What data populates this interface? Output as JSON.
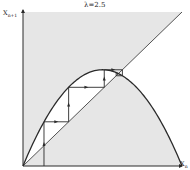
{
  "figure": {
    "title": "λ=2.5",
    "y_axis_label": "X",
    "y_axis_subscript": "n+1",
    "x_axis_label": "X",
    "x_axis_subscript": "n"
  },
  "colors": {
    "shade": "#e6e6e6",
    "line": "#2a2a2a",
    "background": "#ffffff"
  },
  "chart_data": {
    "type": "line",
    "title": "λ=2.5",
    "xlabel": "X_n",
    "ylabel": "X_n+1",
    "xlim": [
      0,
      1
    ],
    "ylim": [
      0,
      1
    ],
    "grid": false,
    "series": [
      {
        "name": "map f(x)=2.5x(1-x)",
        "x": [
          0,
          0.1,
          0.2,
          0.3,
          0.4,
          0.5,
          0.6,
          0.7,
          0.8,
          0.9,
          1.0
        ],
        "y": [
          0,
          0.225,
          0.4,
          0.525,
          0.6,
          0.625,
          0.6,
          0.525,
          0.4,
          0.225,
          0
        ]
      },
      {
        "name": "diagonal y=x",
        "x": [
          0,
          1
        ],
        "y": [
          0,
          1
        ]
      },
      {
        "name": "cobweb iteration",
        "x": [
          0.132,
          0.132,
          0.287,
          0.287,
          0.511,
          0.511,
          0.625,
          0.625,
          0.586,
          0.586,
          0.6
        ],
        "y": [
          0,
          0.287,
          0.287,
          0.511,
          0.511,
          0.625,
          0.625,
          0.586,
          0.586,
          0.606,
          0.6
        ]
      }
    ],
    "annotations": [
      "fixed point at x=0.6",
      "shaded regions: above diagonal & above curve, below diagonal & below curve"
    ]
  }
}
